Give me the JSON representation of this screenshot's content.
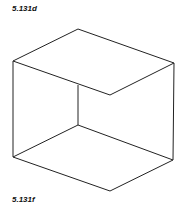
{
  "figure": {
    "top_label": "5.131d",
    "bottom_label": "5.131f",
    "stroke_color": "#222222",
    "lines": [
      {
        "x1": 13,
        "y1": 61,
        "x2": 78,
        "y2": 29
      },
      {
        "x1": 78,
        "y1": 29,
        "x2": 174,
        "y2": 63
      },
      {
        "x1": 13,
        "y1": 61,
        "x2": 110,
        "y2": 95
      },
      {
        "x1": 110,
        "y1": 95,
        "x2": 174,
        "y2": 63
      },
      {
        "x1": 13,
        "y1": 61,
        "x2": 13,
        "y2": 157
      },
      {
        "x1": 174,
        "y1": 63,
        "x2": 173,
        "y2": 160
      },
      {
        "x1": 78,
        "y1": 85,
        "x2": 78,
        "y2": 125
      },
      {
        "x1": 78,
        "y1": 125,
        "x2": 13,
        "y2": 157
      },
      {
        "x1": 78,
        "y1": 125,
        "x2": 173,
        "y2": 160
      },
      {
        "x1": 13,
        "y1": 157,
        "x2": 110,
        "y2": 191
      },
      {
        "x1": 110,
        "y1": 191,
        "x2": 173,
        "y2": 160
      }
    ]
  }
}
